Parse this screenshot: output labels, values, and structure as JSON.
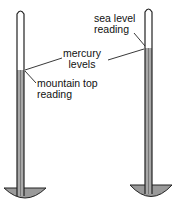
{
  "labels": {
    "sea_level": [
      "sea level",
      "reading"
    ],
    "mercury": [
      "mercury",
      "levels"
    ],
    "mountain_top": [
      "mountain top",
      "reading"
    ]
  },
  "colors": {
    "mercury": "#a8a8a8",
    "outline": "#222222",
    "dish": "#9a9a9a"
  },
  "barometers": [
    {
      "name": "mountain top",
      "mercury_top_y": 70
    },
    {
      "name": "sea level",
      "mercury_top_y": 48
    }
  ]
}
